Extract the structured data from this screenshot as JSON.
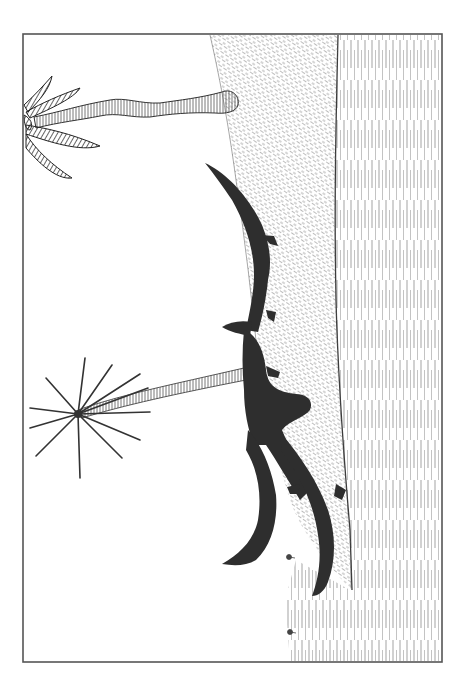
{
  "illustration": {
    "subject": "Pterosaur silhouette gliding beside palm trees over a hatched hillside and lined plain",
    "orientation": "rotated 90 degrees (sideways)",
    "style": "black and white pen-and-ink",
    "frame": {
      "x": 23,
      "y": 34,
      "width": 419,
      "height": 628,
      "stroke": "#555555"
    },
    "colors": {
      "background": "#ffffff",
      "ink": "#2b2b2b",
      "silhouette": "#2e2e2e",
      "hatch": "#6a6a6a",
      "frame": "#555555"
    },
    "elements": [
      {
        "name": "palm-tree-upper",
        "description": "Palm with thick wavy trunk and dark fronds at left edge"
      },
      {
        "name": "palm-tree-lower",
        "description": "Starburst palm with slender striped trunk"
      },
      {
        "name": "pterosaur-silhouette",
        "description": "Solid dark pterosaur with two long curved wings and crested head"
      },
      {
        "name": "hillside",
        "description": "Diagonally hatched slope"
      },
      {
        "name": "plain",
        "description": "Vertically lined ground/water area on right"
      },
      {
        "name": "small-plants",
        "description": "Two tiny plant sprigs near bottom"
      }
    ]
  }
}
